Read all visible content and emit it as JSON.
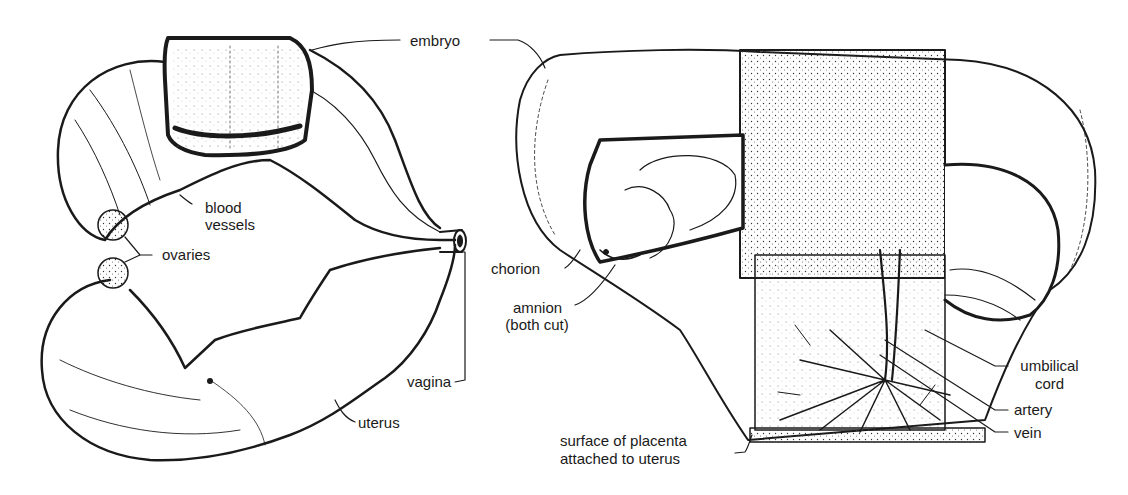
{
  "figure": {
    "left_panel": {
      "name": "uterus-overview",
      "labels": {
        "embryo": "embryo",
        "blood_vessels_line1": "blood",
        "blood_vessels_line2": "vessels",
        "ovaries": "ovaries",
        "vagina": "vagina",
        "uterus": "uterus"
      }
    },
    "right_panel": {
      "name": "embryo-placenta-cutaway",
      "labels": {
        "chorion": "chorion",
        "amnion_line1": "amnion",
        "amnion_line2": "(both cut)",
        "umbilical_line1": "umbilical",
        "umbilical_line2": "cord",
        "artery": "artery",
        "vein": "vein",
        "placenta_line1": "surface of placenta",
        "placenta_line2": "attached to uterus"
      }
    },
    "colors": {
      "ink": "#1a1a1a",
      "paper": "#ffffff"
    }
  }
}
